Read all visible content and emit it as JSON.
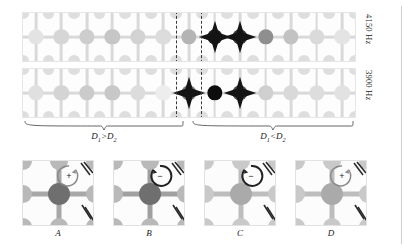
{
  "figure": {
    "kind": "phononic-lattice-mode-shapes",
    "right_rule_color": "#cfcfcf"
  },
  "strips": [
    {
      "id": "strip-top",
      "freq_label": "4150 Hz",
      "x": 22,
      "y": 12,
      "width": 332,
      "height": 48,
      "cols": 13,
      "rows": 2,
      "dashbox": {
        "col_start": 6,
        "col_span": 1
      },
      "node_shades": [
        "#e3e3e3",
        "#d6d6d6",
        "#cdcdcd",
        "#c6c6c6",
        "#d2d2d2",
        "#dcdcdc",
        "#b4b4b4",
        "#1f1f1f",
        "#3a3a3a",
        "#8f8f8f",
        "#c2c2c2",
        "#dadada",
        "#e4e4e4"
      ],
      "star_cols": [
        7,
        8
      ],
      "ligament_shade": "#d9d9d9"
    },
    {
      "id": "strip-bottom",
      "freq_label": "3900 Hz",
      "x": 22,
      "y": 68,
      "width": 332,
      "height": 48,
      "cols": 13,
      "rows": 2,
      "dashbox": {
        "col_start": 6,
        "col_span": 1
      },
      "node_shades": [
        "#e0e0e0",
        "#d4d4d4",
        "#cbcbcb",
        "#c8c8c8",
        "#dcdcdc",
        "#ededed",
        "#7a7a7a",
        "#0d0d0d",
        "#4a4a4a",
        "#cfcfcf",
        "#d9d9d9",
        "#dddddd",
        "#e2e2e2"
      ],
      "star_cols": [
        6,
        8
      ],
      "ligament_shade": "#d9d9d9"
    }
  ],
  "braces": [
    {
      "id": "brace-left",
      "label_html": "D₁>D₂",
      "label_d": "D",
      "sub1": "1",
      "op": ">",
      "sub2": "2",
      "x": 24,
      "y": 118,
      "width": 160,
      "label_text": "D1>D2"
    },
    {
      "id": "brace-right",
      "label_html": "D₁<D₂",
      "label_d": "D",
      "sub1": "1",
      "op": "<",
      "sub2": "2",
      "x": 192,
      "y": 118,
      "width": 162,
      "label_text": "D1<D2"
    }
  ],
  "panels": [
    {
      "id": "panel-a",
      "label": "A",
      "x": 22,
      "y": 160,
      "center_shade": "#6f6f6f",
      "corner_shade": "#b9b9b9",
      "ligament_shade": "#a8a8a8",
      "sign": "+",
      "direction": "ccw"
    },
    {
      "id": "panel-b",
      "label": "B",
      "x": 113,
      "y": 160,
      "center_shade": "#6f6f6f",
      "corner_shade": "#b9b9b9",
      "ligament_shade": "#a0a0a0",
      "sign": "−",
      "direction": "cw"
    },
    {
      "id": "panel-c",
      "label": "C",
      "x": 204,
      "y": 160,
      "center_shade": "#aaaaaa",
      "corner_shade": "#c9c9c9",
      "ligament_shade": "#bdbdbd",
      "sign": "−",
      "direction": "cw"
    },
    {
      "id": "panel-d",
      "label": "D",
      "x": 295,
      "y": 160,
      "center_shade": "#aaaaaa",
      "corner_shade": "#c9c9c9",
      "ligament_shade": "#bdbdbd",
      "sign": "+",
      "direction": "ccw"
    }
  ],
  "chart_data": {
    "type": "heatmap",
    "title": "",
    "xlabel": "unit cell index",
    "ylabel": "",
    "categories": [
      1,
      2,
      3,
      4,
      5,
      6,
      7,
      8,
      9,
      10,
      11,
      12,
      13
    ],
    "series": [
      {
        "name": "4150 Hz",
        "values": [
          0.08,
          0.16,
          0.22,
          0.26,
          0.19,
          0.12,
          0.38,
          0.96,
          0.84,
          0.52,
          0.28,
          0.15,
          0.07
        ]
      },
      {
        "name": "3900 Hz",
        "values": [
          0.1,
          0.18,
          0.24,
          0.25,
          0.14,
          0.05,
          0.62,
          1.0,
          0.76,
          0.2,
          0.15,
          0.12,
          0.09
        ]
      }
    ],
    "legend": [
      "4150 Hz",
      "3900 Hz"
    ],
    "annotations": [
      "D1>D2",
      "D1<D2",
      "A",
      "B",
      "C",
      "D"
    ],
    "grid": false
  }
}
